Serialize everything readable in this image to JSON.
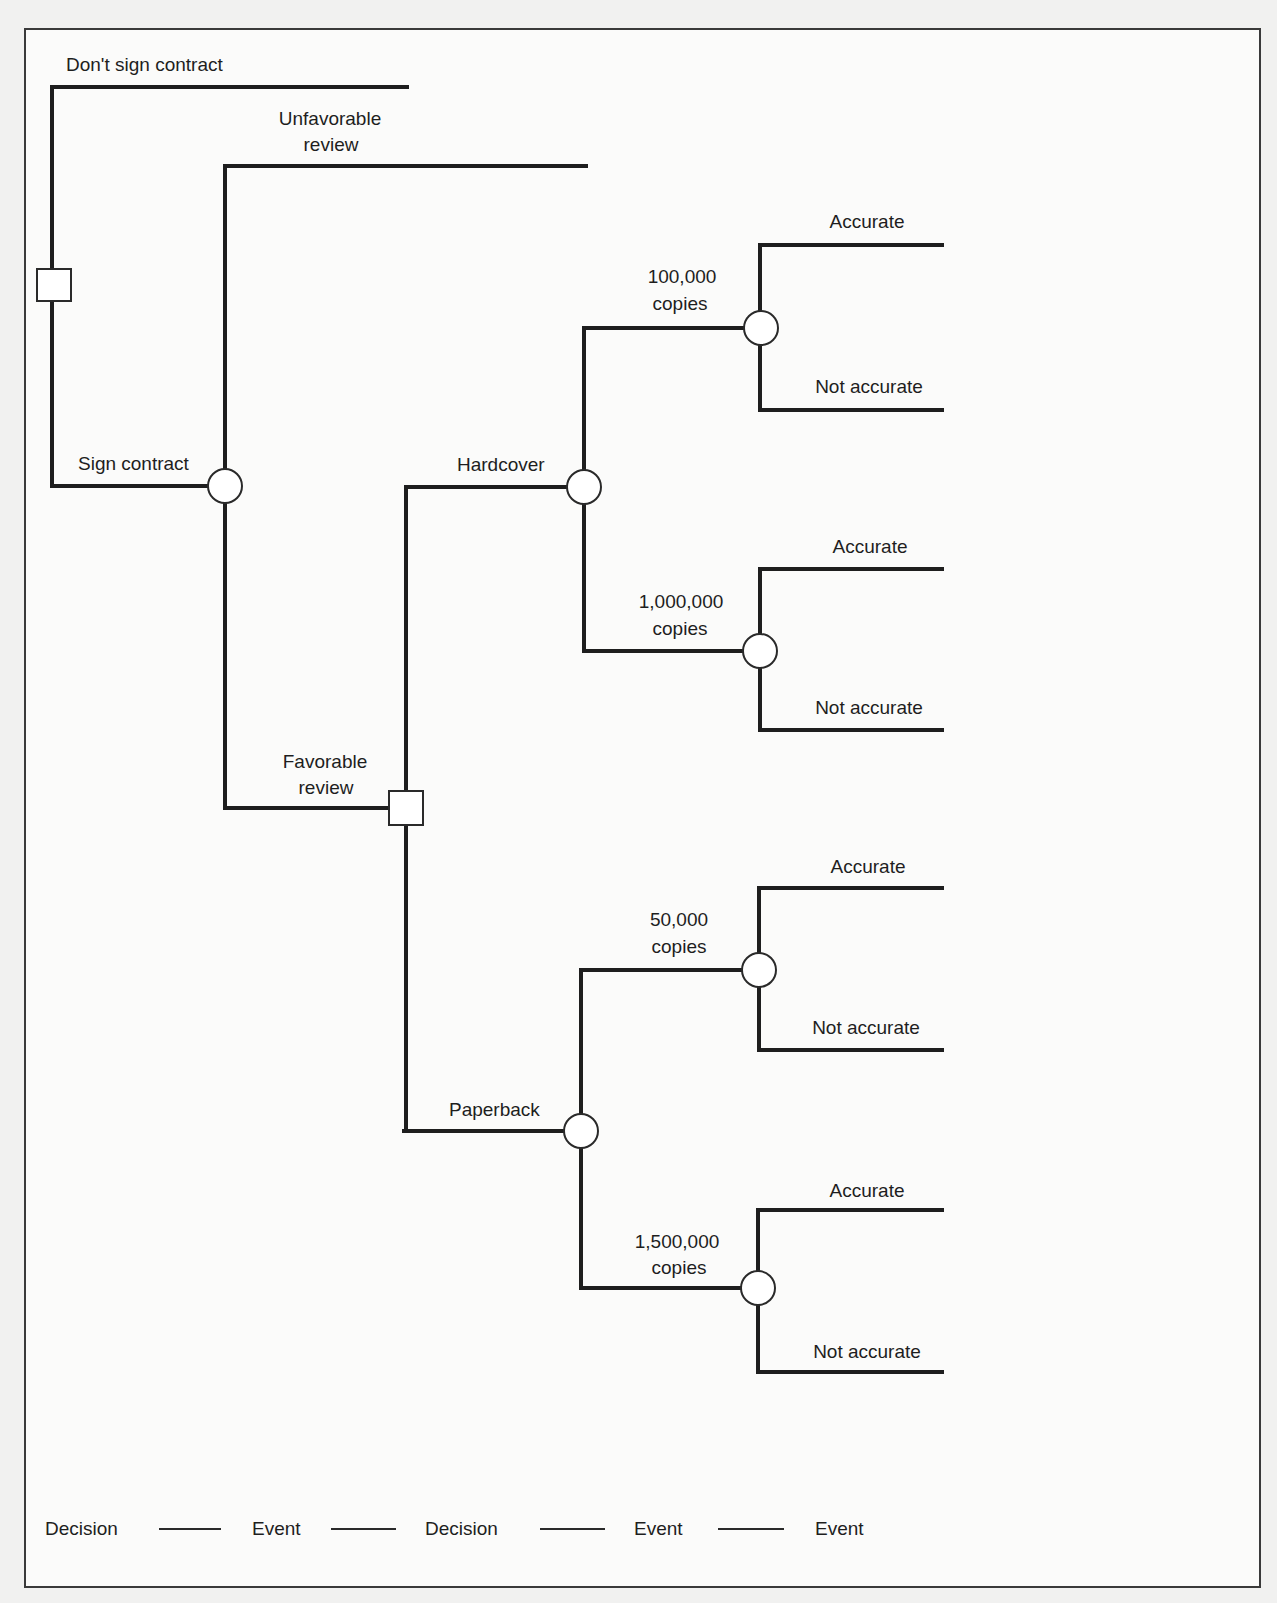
{
  "diagram": {
    "type": "decision-tree",
    "root": {
      "node_type": "decision",
      "branches": [
        {
          "label": "Don't sign contract",
          "terminal": true
        },
        {
          "label": "Sign contract",
          "node_type": "event",
          "branches": [
            {
              "label_lines": [
                "Unfavorable",
                "review"
              ],
              "terminal": true
            },
            {
              "label_lines": [
                "Favorable",
                "review"
              ],
              "node_type": "decision",
              "branches": [
                {
                  "label": "Hardcover",
                  "node_type": "event",
                  "branches": [
                    {
                      "label_lines": [
                        "100,000",
                        "copies"
                      ],
                      "node_type": "event",
                      "branches": [
                        {
                          "label": "Accurate"
                        },
                        {
                          "label": "Not accurate"
                        }
                      ]
                    },
                    {
                      "label_lines": [
                        "1,000,000",
                        "copies"
                      ],
                      "node_type": "event",
                      "branches": [
                        {
                          "label": "Accurate"
                        },
                        {
                          "label": "Not accurate"
                        }
                      ]
                    }
                  ]
                },
                {
                  "label": "Paperback",
                  "node_type": "event",
                  "branches": [
                    {
                      "label_lines": [
                        "50,000",
                        "copies"
                      ],
                      "node_type": "event",
                      "branches": [
                        {
                          "label": "Accurate"
                        },
                        {
                          "label": "Not accurate"
                        }
                      ]
                    },
                    {
                      "label_lines": [
                        "1,500,000",
                        "copies"
                      ],
                      "node_type": "event",
                      "branches": [
                        {
                          "label": "Accurate"
                        },
                        {
                          "label": "Not accurate"
                        }
                      ]
                    }
                  ]
                }
              ]
            }
          ]
        }
      ]
    }
  },
  "labels": {
    "dont_sign": "Don't sign contract",
    "sign": "Sign contract",
    "unfavorable_1": "Unfavorable",
    "unfavorable_2": "review",
    "favorable_1": "Favorable",
    "favorable_2": "review",
    "hardcover": "Hardcover",
    "paperback": "Paperback",
    "hc_low_1": "100,000",
    "hc_low_2": "copies",
    "hc_high_1": "1,000,000",
    "hc_high_2": "copies",
    "pb_low_1": "50,000",
    "pb_low_2": "copies",
    "pb_high_1": "1,500,000",
    "pb_high_2": "copies",
    "accurate": "Accurate",
    "not_accurate": "Not accurate"
  },
  "legend": {
    "stages": [
      "Decision",
      "Event",
      "Decision",
      "Event",
      "Event"
    ]
  },
  "colors": {
    "line": "#1e1e1e",
    "background": "#fbfbfa",
    "page": "#f1f1f0"
  }
}
